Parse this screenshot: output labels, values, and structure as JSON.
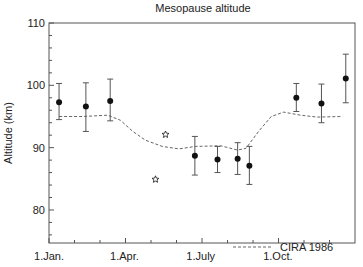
{
  "chart_data": {
    "type": "scatter",
    "title": "Mesopause altitude",
    "xlabel": "",
    "ylabel": "Altitude (km)",
    "ylim": [
      74.7,
      110
    ],
    "yticks": [
      80,
      90,
      100,
      110
    ],
    "xlim_days": [
      0,
      365
    ],
    "xticks": [
      {
        "label": "1.Jan.",
        "day": 0
      },
      {
        "label": "1.Apr.",
        "day": 90
      },
      {
        "label": "1.July",
        "day": 181
      },
      {
        "label": "1.Oct.",
        "day": 273
      }
    ],
    "grid": false,
    "legend_position": "lower right",
    "series": [
      {
        "name": "Measurements",
        "marker": "filled-circle",
        "points": [
          {
            "day": 12,
            "y": 97.3,
            "err_low": 94.5,
            "err_high": 100.3
          },
          {
            "day": 44,
            "y": 96.6,
            "err_low": 92.6,
            "err_high": 100.4
          },
          {
            "day": 73,
            "y": 97.5,
            "err_low": 94.3,
            "err_high": 101.0
          },
          {
            "day": 174,
            "y": 88.7,
            "err_low": 85.6,
            "err_high": 91.8
          },
          {
            "day": 201,
            "y": 88.1,
            "err_low": 86.0,
            "err_high": 90.2
          },
          {
            "day": 225,
            "y": 88.2,
            "err_low": 85.7,
            "err_high": 90.8
          },
          {
            "day": 239,
            "y": 87.1,
            "err_low": 84.1,
            "err_high": 90.2
          },
          {
            "day": 295,
            "y": 98.0,
            "err_low": 95.8,
            "err_high": 100.3
          },
          {
            "day": 325,
            "y": 97.1,
            "err_low": 94.0,
            "err_high": 100.2
          },
          {
            "day": 354,
            "y": 101.1,
            "err_low": 97.2,
            "err_high": 105.0
          }
        ]
      },
      {
        "name": "Other measurements",
        "marker": "open-star",
        "points": [
          {
            "day": 139,
            "y": 92.1
          },
          {
            "day": 127,
            "y": 84.9
          }
        ]
      },
      {
        "name": "CIRA 1986",
        "marker": "none",
        "line": "dashed",
        "points": [
          {
            "day": 12,
            "y": 95.0
          },
          {
            "day": 40,
            "y": 95.0
          },
          {
            "day": 70,
            "y": 95.2
          },
          {
            "day": 85,
            "y": 94.4
          },
          {
            "day": 100,
            "y": 92.6
          },
          {
            "day": 115,
            "y": 91.2
          },
          {
            "day": 135,
            "y": 90.2
          },
          {
            "day": 155,
            "y": 89.8
          },
          {
            "day": 175,
            "y": 90.2
          },
          {
            "day": 205,
            "y": 90.3
          },
          {
            "day": 225,
            "y": 89.6
          },
          {
            "day": 235,
            "y": 89.9
          },
          {
            "day": 250,
            "y": 92.6
          },
          {
            "day": 265,
            "y": 95.0
          },
          {
            "day": 280,
            "y": 95.7
          },
          {
            "day": 300,
            "y": 95.2
          },
          {
            "day": 320,
            "y": 94.9
          },
          {
            "day": 350,
            "y": 95.0
          }
        ]
      }
    ],
    "legend": [
      {
        "label": "CIRA 1986",
        "style": "dashed"
      }
    ]
  },
  "colors": {
    "axis": "#555555",
    "marker": "#111111",
    "errorbar": "#555555",
    "dashed": "#666666",
    "text": "#222222"
  }
}
